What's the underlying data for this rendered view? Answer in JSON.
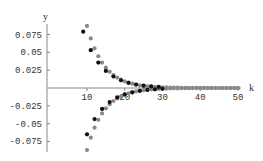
{
  "chart_data": {
    "type": "scatter",
    "title": "",
    "xlabel": "k",
    "ylabel": "y",
    "xlim": [
      0,
      50
    ],
    "ylim": [
      -0.09,
      0.095
    ],
    "grid": false,
    "legend": null,
    "x_ticks": [
      10,
      20,
      30,
      40,
      50
    ],
    "x_tick_labels": [
      "10",
      "20",
      "30",
      "40",
      "50"
    ],
    "y_ticks": [
      0.075,
      0.05,
      0.025,
      -0.025,
      -0.05,
      -0.075
    ],
    "y_tick_labels": [
      "0.075",
      "0.05",
      "0.025",
      "-0.025",
      "-0.05",
      "-0.075"
    ],
    "series": [
      {
        "name": "envelope-upper",
        "color": "#8a8a8a",
        "x": [
          10,
          11,
          12,
          13,
          14,
          15,
          16,
          17,
          18,
          19,
          20,
          21,
          22,
          23,
          24,
          25,
          26,
          27,
          28,
          29,
          30,
          31,
          32,
          33,
          34,
          35,
          36,
          37,
          38,
          39,
          40,
          41,
          42,
          43,
          44,
          45,
          46,
          47,
          48,
          49,
          50
        ],
        "y": [
          0.087,
          0.0696,
          0.0557,
          0.0445,
          0.0356,
          0.0285,
          0.0228,
          0.0182,
          0.0146,
          0.0117,
          0.0093,
          0.0075,
          0.006,
          0.0048,
          0.0038,
          0.0031,
          0.0024,
          0.002,
          0.0016,
          0.0013,
          0.001,
          0.0008,
          0.0007,
          0.0005,
          0.0004,
          0.0003,
          0.0003,
          0.0002,
          0.0002,
          0.0001,
          0.0001,
          0.0001,
          0.0001,
          0.0001,
          0,
          0,
          0,
          0,
          0,
          0,
          0
        ]
      },
      {
        "name": "envelope-lower",
        "color": "#8a8a8a",
        "x": [
          10,
          11,
          12,
          13,
          14,
          15,
          16,
          17,
          18,
          19,
          20,
          21,
          22,
          23,
          24,
          25,
          26,
          27,
          28,
          29,
          30,
          31,
          32,
          33,
          34,
          35,
          36,
          37,
          38,
          39,
          40,
          41,
          42,
          43,
          44,
          45,
          46,
          47,
          48,
          49,
          50
        ],
        "y": [
          -0.087,
          -0.0696,
          -0.0557,
          -0.0445,
          -0.0356,
          -0.0285,
          -0.0228,
          -0.0182,
          -0.0146,
          -0.0117,
          -0.0093,
          -0.0075,
          -0.006,
          -0.0048,
          -0.0038,
          -0.0031,
          -0.0024,
          -0.002,
          -0.0016,
          -0.0013,
          -0.001,
          -0.0008,
          -0.0007,
          -0.0005,
          -0.0004,
          -0.0003,
          -0.0003,
          -0.0002,
          -0.0002,
          -0.0001,
          -0.0001,
          -0.0001,
          -0.0001,
          -0.0001,
          0,
          0,
          0,
          0,
          0,
          0,
          0
        ]
      },
      {
        "name": "alternating-sequence",
        "color": "#111111",
        "x": [
          9,
          10,
          11,
          12,
          13,
          14,
          15,
          16,
          17,
          18,
          19,
          20,
          21,
          22,
          23,
          24,
          25,
          26,
          27,
          28,
          29,
          30
        ],
        "y": [
          0.079,
          -0.065,
          0.053,
          -0.0436,
          0.0357,
          -0.0293,
          0.024,
          -0.0197,
          0.0161,
          -0.0132,
          0.0109,
          -0.0089,
          0.0073,
          -0.006,
          0.0049,
          -0.004,
          0.0033,
          -0.0027,
          0.0022,
          -0.0018,
          0.0015,
          -0.0012
        ]
      }
    ]
  }
}
